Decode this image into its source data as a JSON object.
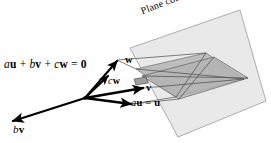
{
  "figure": {
    "background_color": "#ffffff",
    "line_color": "#000000",
    "plane_fill": "#e9e9e9",
    "plane_stroke": "#9a9a9a",
    "inner_fill": "#b9b9b9",
    "inner_stroke": "#555555"
  },
  "labels": {
    "equation": {
      "scalar_a": "a",
      "vector_u": "u",
      "plus_1": " + ",
      "scalar_b": "b",
      "vector_v": "v",
      "plus_2": " + ",
      "scalar_c": "c",
      "vector_w": "w",
      "equals": " = ",
      "zero": "0"
    },
    "plane_caption": {
      "text_part": "Plane containing ",
      "vector_u": "u",
      "comma_1": ", ",
      "vector_v": "v",
      "comma_2": ", ",
      "vector_w": "w"
    },
    "vector_w": "w",
    "vector_cw": {
      "scalar": "c",
      "vector": "w"
    },
    "vector_v": "v",
    "vector_au": {
      "scalar": "a",
      "vector": "u",
      "equals": " = ",
      "result": "u"
    },
    "vector_bv": {
      "scalar": "b",
      "vector": "v"
    }
  },
  "geometry": {
    "origin": {
      "x": 85,
      "y": 98
    },
    "arrows": [
      {
        "name": "w",
        "tip_x": 117,
        "tip_y": 60
      },
      {
        "name": "cw",
        "tip_x": 107,
        "tip_y": 75
      },
      {
        "name": "v",
        "tip_x": 144,
        "tip_y": 88
      },
      {
        "name": "au",
        "tip_x": 132,
        "tip_y": 104
      },
      {
        "name": "bv",
        "tip_x": 12,
        "tip_y": 121
      }
    ],
    "plane_corners": [
      {
        "x": 130,
        "y": 48
      },
      {
        "x": 240,
        "y": 10
      },
      {
        "x": 266,
        "y": 101
      },
      {
        "x": 178,
        "y": 137
      }
    ]
  }
}
